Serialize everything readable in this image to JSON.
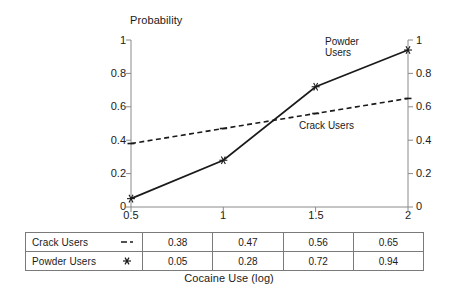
{
  "chart_data": {
    "type": "line",
    "title": "",
    "xlabel": "Cocaine Use (log)",
    "ylabel": "Probability",
    "x": [
      0.5,
      1,
      1.5,
      2
    ],
    "xticklabels": [
      "0.5",
      "1",
      "1.5",
      "2"
    ],
    "ylim": [
      0,
      1
    ],
    "yticks": [
      0,
      0.2,
      0.4,
      0.6,
      0.8,
      1
    ],
    "yticklabels": [
      "0",
      "0.2",
      "0.4",
      "0.6",
      "0.8",
      "1"
    ],
    "right_axis": {
      "ylim": [
        0,
        1
      ],
      "yticklabels": [
        "0",
        "0.2",
        "0.4",
        "0.6",
        "0.8",
        "1"
      ]
    },
    "grid": false,
    "legend_position": "table-below",
    "series": [
      {
        "name": "Crack Users",
        "values": [
          0.38,
          0.47,
          0.56,
          0.65
        ],
        "style": "dashed",
        "marker": "dash",
        "color": "#1a1a1a"
      },
      {
        "name": "Powder Users",
        "values": [
          0.05,
          0.28,
          0.72,
          0.94
        ],
        "style": "solid",
        "marker": "asterisk",
        "color": "#1a1a1a"
      }
    ],
    "annotations": [
      {
        "text_line1": "Powder",
        "text_line2": "Users"
      },
      {
        "text_line1": "Crack Users",
        "text_line2": ""
      }
    ]
  },
  "table": {
    "rows": [
      {
        "label": "Crack Users",
        "marker": "dash-marker",
        "values": [
          "0.38",
          "0.47",
          "0.56",
          "0.65"
        ]
      },
      {
        "label": "Powder Users",
        "marker": "asterisk-marker",
        "values": [
          "0.05",
          "0.28",
          "0.72",
          "0.94"
        ]
      }
    ]
  },
  "axis": {
    "y_title": "Probability",
    "x_title": "Cocaine Use (log)",
    "y_labels": [
      "1",
      "0.8",
      "0.6",
      "0.4",
      "0.2",
      "0"
    ],
    "y_labels_right": [
      "1",
      "0.8",
      "0.6",
      "0.4",
      "0.2",
      "0"
    ],
    "x_labels": [
      "0.5",
      "1",
      "1.5",
      "2"
    ]
  },
  "annotations": {
    "powder_line1": "Powder",
    "powder_line2": "Users",
    "crack": "Crack Users"
  },
  "colors": {
    "ink": "#1a1a1a",
    "axis": "#7a7a7a",
    "background": "#ffffff"
  }
}
